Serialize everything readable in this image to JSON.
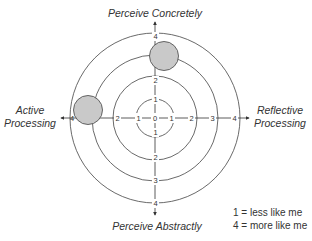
{
  "diagram": {
    "axes": {
      "top": "Perceive Concretely",
      "bottom": "Perceive Abstractly",
      "left_line1": "Active",
      "left_line2": "Processing",
      "right_line1": "Reflective",
      "right_line2": "Processing"
    },
    "center_label": "0",
    "ticks": {
      "left": [
        "2",
        "1"
      ],
      "left_outer": "4",
      "right": [
        "1",
        "2",
        "3",
        "4"
      ],
      "up": [
        "1",
        "2",
        "4"
      ],
      "down": [
        "1",
        "2",
        "3",
        "4"
      ]
    },
    "rings": [
      1,
      2,
      3,
      4
    ],
    "markers": [
      {
        "name": "concrete-marker",
        "axis": "Perceive Concretely",
        "value": 3
      },
      {
        "name": "active-marker",
        "axis": "Active Processing",
        "value": 4
      }
    ],
    "marker_fill": "#c9c9c9",
    "marker_stroke": "#555555",
    "line_color": "#333333"
  },
  "legend": {
    "line1": "1 = less like me",
    "line2": "4 = more like me"
  }
}
